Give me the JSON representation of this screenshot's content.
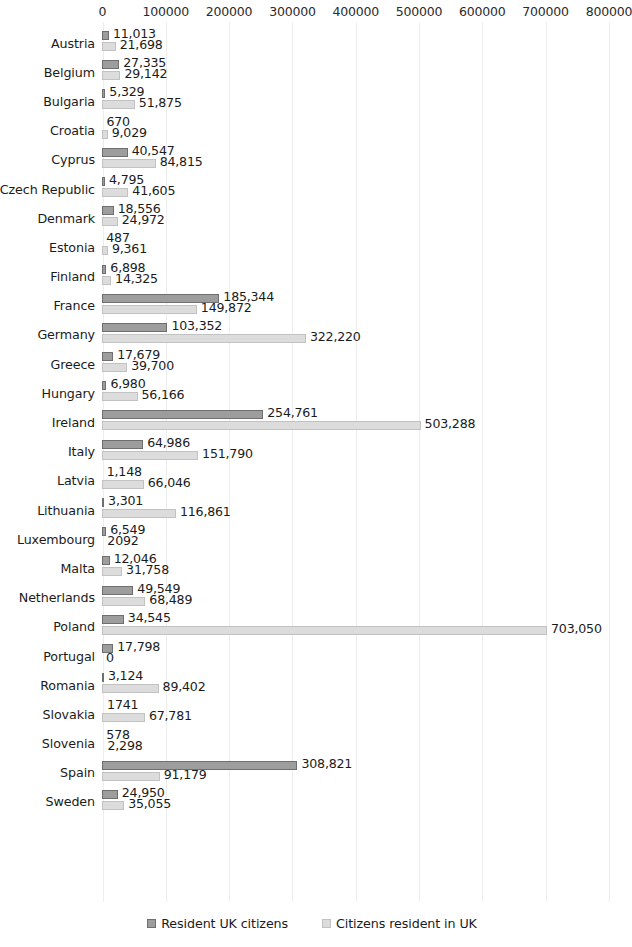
{
  "chart_data": {
    "type": "bar",
    "orientation": "horizontal",
    "title": "",
    "xlabel": "",
    "ylabel": "",
    "xlim": [
      0,
      800000
    ],
    "xticks": [
      0,
      100000,
      200000,
      300000,
      400000,
      500000,
      600000,
      700000,
      800000
    ],
    "xtick_labels": [
      "0",
      "100000",
      "200000",
      "300000",
      "400000",
      "500000",
      "600000",
      "700000",
      "800000"
    ],
    "grid": true,
    "legend_position": "bottom",
    "categories": [
      "Austria",
      "Belgium",
      "Bulgaria",
      "Croatia",
      "Cyprus",
      "Czech Republic",
      "Denmark",
      "Estonia",
      "Finland",
      "France",
      "Germany",
      "Greece",
      "Hungary",
      "Ireland",
      "Italy",
      "Latvia",
      "Lithuania",
      "Luxembourg",
      "Malta",
      "Netherlands",
      "Poland",
      "Portugal",
      "Romania",
      "Slovakia",
      "Slovenia",
      "Spain",
      "Sweden"
    ],
    "series": [
      {
        "name": "Resident UK citizens",
        "color": "#9d9d9d",
        "values": [
          11013,
          27335,
          5329,
          670,
          40547,
          4795,
          18556,
          487,
          6898,
          185344,
          103352,
          17679,
          6980,
          254761,
          64986,
          1148,
          3301,
          6549,
          12046,
          49549,
          34545,
          17798,
          3124,
          1741,
          578,
          308821,
          24950
        ],
        "labels": [
          "11,013",
          "27,335",
          "5,329",
          "670",
          "40,547",
          "4,795",
          "18,556",
          "487",
          "6,898",
          "185,344",
          "103,352",
          "17,679",
          "6,980",
          "254,761",
          "64,986",
          "1,148",
          "3,301",
          "6,549",
          "12,046",
          "49,549",
          "34,545",
          "17,798",
          "3,124",
          "1741",
          "578",
          "308,821",
          "24,950"
        ]
      },
      {
        "name": "Citizens resident in UK",
        "color": "#dcdcdc",
        "values": [
          21698,
          29142,
          51875,
          9029,
          84815,
          41605,
          24972,
          9361,
          14325,
          149872,
          322220,
          39700,
          56166,
          503288,
          151790,
          66046,
          116861,
          2092,
          31758,
          68489,
          703050,
          0,
          89402,
          67781,
          2298,
          91179,
          35055
        ],
        "labels": [
          "21,698",
          "29,142",
          "51,875",
          "9,029",
          "84,815",
          "41,605",
          "24,972",
          "9,361",
          "14,325",
          "149,872",
          "322,220",
          "39,700",
          "56,166",
          "503,288",
          "151,790",
          "66,046",
          "116,861",
          "2092",
          "31,758",
          "68,489",
          "703,050",
          "0",
          "89,402",
          "67,781",
          "2,298",
          "91,179",
          "35,055"
        ]
      }
    ]
  },
  "legend": {
    "items": [
      {
        "label": "Resident UK citizens"
      },
      {
        "label": "Citizens resident in UK"
      }
    ]
  }
}
